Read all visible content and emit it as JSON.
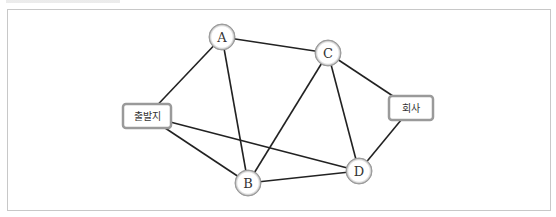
{
  "diagram": {
    "type": "graph",
    "nodes": [
      {
        "id": "start",
        "label": "출발지",
        "shape": "rounded-box",
        "x": 147,
        "y": 116,
        "w": 48,
        "h": 24
      },
      {
        "id": "A",
        "label": "A",
        "shape": "circle",
        "x": 222,
        "y": 37
      },
      {
        "id": "C",
        "label": "C",
        "shape": "circle",
        "x": 328,
        "y": 53
      },
      {
        "id": "office",
        "label": "회사",
        "shape": "rounded-box",
        "x": 411,
        "y": 108,
        "w": 44,
        "h": 24
      },
      {
        "id": "B",
        "label": "B",
        "shape": "circle",
        "x": 248,
        "y": 183
      },
      {
        "id": "D",
        "label": "D",
        "shape": "circle",
        "x": 359,
        "y": 171
      }
    ],
    "edges": [
      [
        "start",
        "A"
      ],
      [
        "start",
        "B"
      ],
      [
        "start",
        "D"
      ],
      [
        "A",
        "C"
      ],
      [
        "A",
        "B"
      ],
      [
        "C",
        "B"
      ],
      [
        "C",
        "D"
      ],
      [
        "C",
        "office"
      ],
      [
        "office",
        "D"
      ],
      [
        "B",
        "D"
      ]
    ]
  },
  "colors": {
    "edge": "#222222",
    "node_border": "#9a9a9a",
    "frame": "#c8c8c8"
  }
}
